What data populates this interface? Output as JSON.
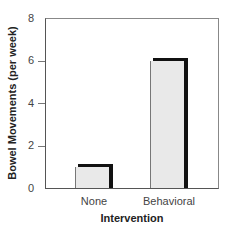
{
  "chart_data": {
    "type": "bar",
    "title": "",
    "categories": [
      "None",
      "Behavioral"
    ],
    "values": [
      1,
      6
    ],
    "xlabel": "Intervention",
    "ylabel": "Bowel Movements (per week)",
    "ylim": [
      0,
      8
    ],
    "yticks": [
      0,
      2,
      4,
      6,
      8
    ],
    "grid": false,
    "legend": null
  },
  "axis": {
    "ytick_labels": [
      "0",
      "2",
      "4",
      "6",
      "8"
    ]
  }
}
